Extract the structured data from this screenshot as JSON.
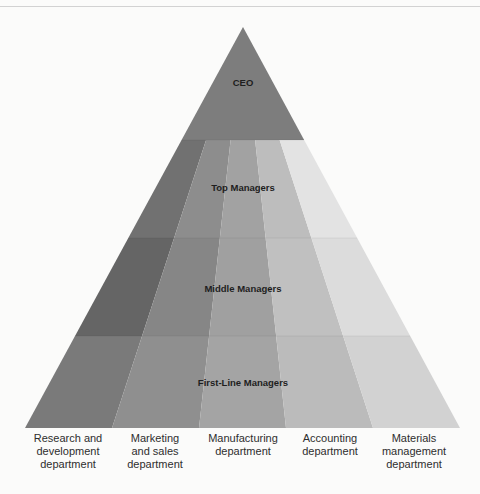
{
  "diagram": {
    "type": "organizational-pyramid",
    "levels": [
      {
        "label": "CEO"
      },
      {
        "label": "Top Managers"
      },
      {
        "label": "Middle Managers"
      },
      {
        "label": "First-Line Managers"
      }
    ],
    "departments": [
      {
        "label": "Research and\ndevelopment\ndepartment"
      },
      {
        "label": "Marketing\nand sales\ndepartment"
      },
      {
        "label": "Manufacturing\ndepartment"
      },
      {
        "label": "Accounting\ndepartment"
      },
      {
        "label": "Materials\nmanagement\ndepartment"
      }
    ],
    "colors": {
      "ceo": "#7d7d7d",
      "band_columns": [
        [
          "#717171",
          "#8d8d8d",
          "#a2a2a2",
          "#bdbdbd",
          "#e3e3e3"
        ],
        [
          "#656565",
          "#868686",
          "#a0a0a0",
          "#c0c0c0",
          "#dcdcdc"
        ],
        [
          "#7a7a7a",
          "#8f8f8f",
          "#a4a4a4",
          "#bbbbbb",
          "#d2d2d2"
        ]
      ]
    }
  }
}
